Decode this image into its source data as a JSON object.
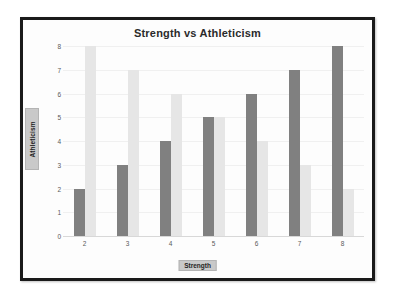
{
  "chart_data": {
    "type": "bar",
    "title": "Strength vs Athleticism",
    "xlabel": "Strength",
    "ylabel": "Athleticism",
    "categories": [
      "2",
      "3",
      "4",
      "5",
      "6",
      "7",
      "8"
    ],
    "series": [
      {
        "name": "series-a",
        "color": "#808080",
        "values": [
          2,
          3,
          4,
          5,
          6,
          7,
          8
        ]
      },
      {
        "name": "series-b",
        "color": "#e6e6e6",
        "values": [
          8,
          7,
          6,
          5,
          4,
          3,
          2
        ]
      }
    ],
    "ylim": [
      0,
      8
    ],
    "yticks": [
      0,
      1,
      2,
      3,
      4,
      5,
      6,
      7,
      8
    ],
    "ytick_labels": [
      "0",
      "1",
      "2",
      "3",
      "4",
      "5",
      "6",
      "7",
      "8"
    ],
    "grid": true,
    "legend": false,
    "legend_position": "none",
    "plot_background": "#fdfdfd",
    "frame_color": "#1a1a1a",
    "axis_label_background": "#c9c9c9"
  }
}
